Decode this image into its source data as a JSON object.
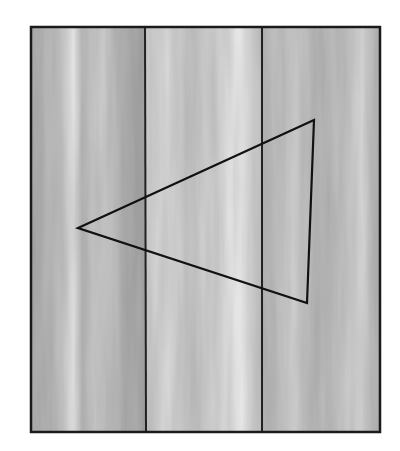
{
  "figure": {
    "frame": {
      "x": 30,
      "y": 27,
      "width": 350,
      "height": 405,
      "stroke": "#1a1a1a"
    },
    "planks": [
      {
        "x": 30,
        "width": 115,
        "base": "#b9b9b9"
      },
      {
        "x": 145,
        "width": 117,
        "base": "#cfcfcf"
      },
      {
        "x": 262,
        "width": 118,
        "base": "#bdbdbd"
      }
    ],
    "dividers": [
      145,
      262
    ],
    "triangle": {
      "points": [
        [
          78,
          228
        ],
        [
          314,
          120
        ],
        [
          307,
          303
        ]
      ],
      "stroke": "#111111"
    }
  }
}
